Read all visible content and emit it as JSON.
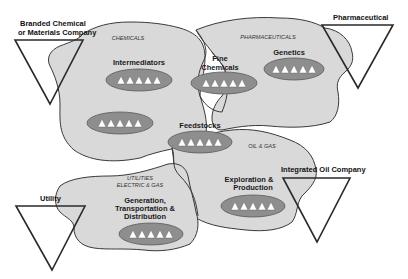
{
  "regions": {
    "chemicals": "CHEMICALS",
    "pharmaceuticals": "PHARMACEUTICALS",
    "oil_gas": "OIL & GAS",
    "utilities_line1": "UTILITIES",
    "utilities_line2": "ELECTRIC & GAS"
  },
  "segments": {
    "intermediators": "Intermediators",
    "fine_chemicals_line1": "Fine",
    "fine_chemicals_line2": "Chemicals",
    "genetics": "Genetics",
    "feedstocks": "Feedstocks",
    "exploration_line1": "Exploration &",
    "exploration_line2": "Production",
    "generation_line1": "Generation,",
    "generation_line2": "Transportation &",
    "generation_line3": "Distribution"
  },
  "companies": {
    "branded_line1": "Branded Chemical",
    "branded_line2": "or Materials Company",
    "pharmaceutical": "Pharmaceutical",
    "integrated_oil": "Integrated Oil Company",
    "utility": "Utility"
  },
  "colors": {
    "region_fill": "#d9d9d9",
    "pill_fill": "#8e8e8e",
    "outline": "#3a3a3a"
  }
}
